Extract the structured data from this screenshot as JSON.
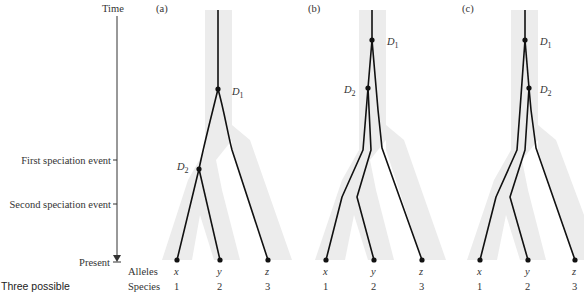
{
  "axis": {
    "title": "Time",
    "events": [
      {
        "label": "First speciation event",
        "y": 160
      },
      {
        "label": "Second speciation event",
        "y": 204
      }
    ],
    "end_label": "Present"
  },
  "row_labels": {
    "alleles": "Alleles",
    "species": "Species"
  },
  "panels": [
    {
      "id": "a",
      "label": "(a)",
      "d1": "D",
      "d1_sub": "1",
      "d2": "D",
      "d2_sub": "2",
      "alleles": [
        "x",
        "y",
        "z"
      ],
      "species": [
        "1",
        "2",
        "3"
      ]
    },
    {
      "id": "b",
      "label": "(b)",
      "d1": "D",
      "d1_sub": "1",
      "d2": "D",
      "d2_sub": "2",
      "alleles": [
        "x",
        "y",
        "z"
      ],
      "species": [
        "1",
        "2",
        "3"
      ]
    },
    {
      "id": "c",
      "label": "(c)",
      "d1": "D",
      "d1_sub": "1",
      "d2": "D",
      "d2_sub": "2",
      "alleles": [
        "x",
        "y",
        "z"
      ],
      "species": [
        "1",
        "2",
        "3"
      ]
    }
  ],
  "caption": "Three possible"
}
